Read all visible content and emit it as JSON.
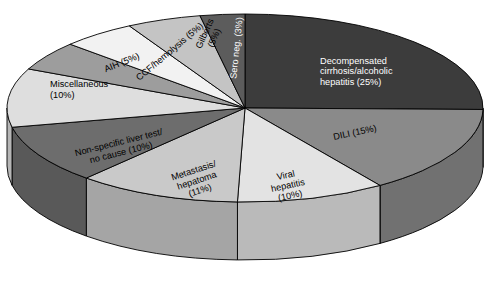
{
  "chart_data": {
    "type": "pie",
    "title": "",
    "subtitle": "",
    "xlabel": "",
    "ylabel": "",
    "legend_position": "none",
    "grid": false,
    "three_d": true,
    "start_angle_deg": 0,
    "direction": "clockwise",
    "categories": [
      "Decompensated cirrhosis/alcoholic hepatitis",
      "DILI",
      "Viral hepatitis",
      "Metastasis/hepatoma",
      "Non-specific liver test/no cause",
      "Miscellaneous",
      "AIH",
      "CCF/hemolysis",
      "Gilberts",
      "Sero neg."
    ],
    "values": [
      25,
      15,
      10,
      11,
      10,
      10,
      5,
      5,
      5,
      3
    ],
    "units": "%",
    "colors": [
      "#3c3c3c",
      "#8a8a8a",
      "#e3e3e3",
      "#c9c9c9",
      "#6d6d6d",
      "#dedede",
      "#9d9d9d",
      "#f2f2f2",
      "#c4c4c4",
      "#5c5c5c"
    ],
    "slices": [
      {
        "name": "Decompensated cirrhosis/alcoholic hepatitis",
        "value": 25,
        "color": "#3c3c3c",
        "label_lines": [
          "Decompensated",
          "cirrhosis/alcoholic",
          "hepatitis (25%)"
        ],
        "label_color": "light",
        "label_rotation": 0
      },
      {
        "name": "DILI",
        "value": 15,
        "color": "#8a8a8a",
        "label_lines": [
          "DILI (15%)"
        ],
        "label_color": "dark",
        "label_rotation": -12
      },
      {
        "name": "Viral hepatitis",
        "value": 10,
        "color": "#e3e3e3",
        "label_lines": [
          "Viral",
          "hepatitis",
          "(10%)"
        ],
        "label_color": "dark",
        "label_rotation": -12
      },
      {
        "name": "Metastasis/hepatoma",
        "value": 11,
        "color": "#c9c9c9",
        "label_lines": [
          "Metastasis/",
          "hepatoma",
          "(11%)"
        ],
        "label_color": "dark",
        "label_rotation": -18
      },
      {
        "name": "Non-specific liver test/no cause",
        "value": 10,
        "color": "#6d6d6d",
        "label_lines": [
          "Non-specific liver test/",
          "no cause (10%)"
        ],
        "label_color": "dark",
        "label_rotation": -14
      },
      {
        "name": "Miscellaneous",
        "value": 10,
        "color": "#dedede",
        "label_lines": [
          "Miscellaneous",
          "(10%)"
        ],
        "label_color": "dark",
        "label_rotation": 0
      },
      {
        "name": "AIH",
        "value": 5,
        "color": "#9d9d9d",
        "label_lines": [
          "AIH (5%)"
        ],
        "label_color": "dark",
        "label_rotation": -22
      },
      {
        "name": "CCF/hemolysis",
        "value": 5,
        "color": "#f2f2f2",
        "label_lines": [
          "CCF/hemolysis (5%)"
        ],
        "label_color": "dark",
        "label_rotation": -40
      },
      {
        "name": "Gilberts",
        "value": 5,
        "color": "#c4c4c4",
        "label_lines": [
          "Gilberts",
          "(5%)"
        ],
        "label_color": "dark",
        "label_rotation": -66
      },
      {
        "name": "Sero neg.",
        "value": 3,
        "color": "#5c5c5c",
        "label_lines": [
          "Sero neg. (3%)"
        ],
        "label_color": "light",
        "label_rotation": -84
      }
    ]
  },
  "geometry": {
    "cx": 245,
    "cy": 108,
    "rx": 238,
    "ry": 94,
    "depth": 58,
    "stroke": "#000000",
    "background": "#ffffff"
  },
  "labels": {
    "decompensated_l1": "Decompensated",
    "decompensated_l2": "cirrhosis/alcoholic",
    "decompensated_l3": "hepatitis (25%)",
    "dili": "DILI (15%)",
    "viral_l1": "Viral",
    "viral_l2": "hepatitis",
    "viral_l3": "(10%)",
    "metastasis_l1": "Metastasis/",
    "metastasis_l2": "hepatoma",
    "metastasis_l3": "(11%)",
    "nonspecific_l1": "Non-specific liver test/",
    "nonspecific_l2": "no cause (10%)",
    "misc_l1": "Miscellaneous",
    "misc_l2": "(10%)",
    "aih": "AIH (5%)",
    "ccf": "CCF/hemolysis (5%)",
    "gilberts_l1": "Gilberts",
    "gilberts_l2": "(5%)",
    "seroneg": "Sero neg. (3%)"
  }
}
